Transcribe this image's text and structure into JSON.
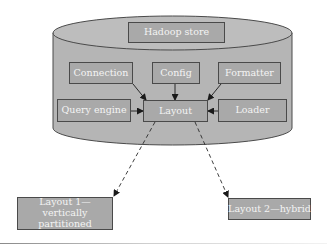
{
  "diagram": {
    "container": {
      "shape": "cylinder",
      "label": "Hadoop store",
      "fill": "#b5b5b5",
      "stroke": "#4a4a4a"
    },
    "nodes": {
      "hadoop_store": "Hadoop store",
      "connection": "Connection",
      "config": "Config",
      "formatter": "Formatter",
      "query_engine": "Query engine",
      "layout": "Layout",
      "loader": "Loader",
      "layout1": "Layout 1—vertically partitioned",
      "layout2": "Layout 2—hybrid"
    },
    "edges": [
      {
        "from": "Connection",
        "to": "Layout",
        "style": "solid",
        "arrow": true
      },
      {
        "from": "Config",
        "to": "Layout",
        "style": "solid",
        "arrow": true
      },
      {
        "from": "Formatter",
        "to": "Layout",
        "style": "solid",
        "arrow": true
      },
      {
        "from": "Query engine",
        "to": "Layout",
        "style": "solid",
        "arrow": true
      },
      {
        "from": "Loader",
        "to": "Layout",
        "style": "solid",
        "arrow": true
      },
      {
        "from": "Layout",
        "to": "Layout 1—vertically partitioned",
        "style": "dashed",
        "arrow": true
      },
      {
        "from": "Layout",
        "to": "Layout 2—hybrid",
        "style": "dashed",
        "arrow": true
      }
    ],
    "colors": {
      "box_fill": "#a9a9a9",
      "cylinder_fill": "#b5b5b5",
      "stroke": "#4a4a4a",
      "text": "#f4f4f4"
    }
  }
}
